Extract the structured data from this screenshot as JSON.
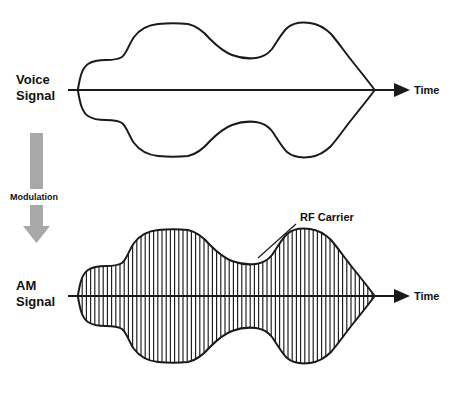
{
  "diagram": {
    "background_color": "#ffffff",
    "stroke_color": "#1a1a1a",
    "arrow_color": "#a8a8a8"
  },
  "voice_section": {
    "label_line1": "Voice",
    "label_line2": "Signal",
    "axis_label": "Time",
    "axis_y": 90,
    "axis_x_start": 68,
    "axis_x_end": 400
  },
  "modulation": {
    "label": "Modulation",
    "arrow_icon": "down-arrow-icon",
    "arrow_color": "#a8a8a8",
    "arrow_x": 36,
    "arrow_top": 133,
    "arrow_bottom": 243
  },
  "am_section": {
    "label_line1": "AM",
    "label_line2": "Signal",
    "axis_label": "Time",
    "axis_y": 296,
    "axis_x_start": 68,
    "axis_x_end": 400,
    "carrier_annotation": "RF Carrier",
    "carrier_label_x": 300,
    "carrier_label_y": 221,
    "hatch_spacing": 4.2
  },
  "chart_data": {
    "type": "line",
    "xlabel": "Time",
    "ylabel": "",
    "series": [
      {
        "name": "Voice Signal Envelope (upper)",
        "x": [
          78,
          86,
          96,
          104,
          112,
          122,
          132,
          144,
          158,
          172,
          186,
          200,
          214,
          228,
          240,
          252,
          262,
          272,
          282,
          294,
          306,
          318,
          330,
          342,
          352,
          362,
          372,
          378
        ],
        "y": [
          89,
          74,
          64,
          61,
          60,
          58,
          48,
          36,
          28,
          24,
          23,
          25,
          31,
          40,
          48,
          54,
          57,
          57,
          54,
          44,
          32,
          25,
          23,
          26,
          36,
          52,
          72,
          88
        ]
      },
      {
        "name": "Voice Signal Envelope (lower)",
        "x": [
          78,
          86,
          96,
          104,
          112,
          122,
          132,
          144,
          158,
          172,
          186,
          200,
          214,
          228,
          240,
          252,
          262,
          272,
          282,
          294,
          306,
          318,
          330,
          342,
          352,
          362,
          372,
          378
        ],
        "y": [
          91,
          106,
          116,
          119,
          120,
          122,
          132,
          144,
          152,
          156,
          157,
          155,
          149,
          140,
          132,
          126,
          123,
          123,
          126,
          136,
          148,
          155,
          157,
          154,
          144,
          128,
          108,
          92
        ]
      },
      {
        "name": "AM Signal Envelope (upper)",
        "x": [
          78,
          86,
          96,
          104,
          112,
          122,
          132,
          144,
          158,
          172,
          186,
          200,
          214,
          228,
          240,
          252,
          262,
          272,
          282,
          294,
          306,
          318,
          330,
          342,
          352,
          362,
          372,
          378
        ],
        "y": [
          295,
          280,
          270,
          267,
          266,
          264,
          254,
          242,
          234,
          230,
          229,
          231,
          237,
          246,
          254,
          260,
          263,
          263,
          260,
          250,
          238,
          231,
          229,
          232,
          242,
          258,
          278,
          294
        ]
      },
      {
        "name": "AM Signal Envelope (lower)",
        "x": [
          78,
          86,
          96,
          104,
          112,
          122,
          132,
          144,
          158,
          172,
          186,
          200,
          214,
          228,
          240,
          252,
          262,
          272,
          282,
          294,
          306,
          318,
          330,
          342,
          352,
          362,
          372,
          378
        ],
        "y": [
          297,
          312,
          322,
          325,
          326,
          328,
          338,
          350,
          358,
          362,
          363,
          361,
          355,
          346,
          338,
          332,
          329,
          329,
          332,
          342,
          354,
          361,
          363,
          360,
          350,
          334,
          314,
          298
        ]
      }
    ],
    "annotations": [
      {
        "text": "Voice Signal",
        "x": 16,
        "y": 84
      },
      {
        "text": "Modulation",
        "x": 10,
        "y": 200
      },
      {
        "text": "AM Signal",
        "x": 16,
        "y": 290
      },
      {
        "text": "RF Carrier",
        "x": 300,
        "y": 221
      },
      {
        "text": "Time",
        "x": 414,
        "y": 94
      },
      {
        "text": "Time",
        "x": 414,
        "y": 300
      }
    ],
    "grid": false,
    "legend": "none"
  }
}
